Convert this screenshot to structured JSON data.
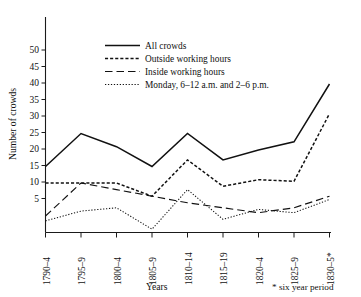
{
  "chart_data": {
    "type": "line",
    "title": "",
    "xlabel": "Years",
    "ylabel": "Number of crowds",
    "categories": [
      "1790–4",
      "1795–9",
      "1800–4",
      "1805–9",
      "1810–14",
      "1815–19",
      "1820–4",
      "1825–9",
      "1830–5*"
    ],
    "ylim": [
      0,
      55
    ],
    "yticks": [
      5,
      10,
      15,
      20,
      25,
      30,
      35,
      40,
      45,
      50
    ],
    "grid": false,
    "legend_position": "upper-center",
    "footnote": "* six year period",
    "series": [
      {
        "name": "All crowds",
        "style": "solid",
        "values": [
          20,
          30,
          26,
          20,
          30,
          22,
          25,
          27.5,
          45
        ]
      },
      {
        "name": "Outside working hours",
        "style": "dashed-short",
        "values": [
          15,
          15,
          15,
          11,
          22,
          14,
          16,
          15.5,
          36
        ]
      },
      {
        "name": "Inside working hours",
        "style": "dashed-long",
        "values": [
          5,
          15,
          13,
          11,
          9,
          7.5,
          6,
          7.5,
          11
        ]
      },
      {
        "name": "Monday, 6–12 a.m. and 2–6 p.m.",
        "style": "dotted",
        "values": [
          3.5,
          6.5,
          7.5,
          1,
          13,
          4,
          7,
          6,
          10
        ]
      }
    ]
  },
  "legend": {
    "items": [
      {
        "label": "All crowds"
      },
      {
        "label": "Outside working hours"
      },
      {
        "label": "Inside working hours"
      },
      {
        "label": "Monday, 6–12 a.m. and 2–6 p.m."
      }
    ]
  },
  "axes": {
    "y_label": "Number of crowds",
    "x_label": "Years",
    "y_tick_labels": [
      "50",
      "45",
      "40",
      "35",
      "30",
      "25",
      "20",
      "15",
      "10",
      "5"
    ],
    "x_tick_labels": [
      "1790–4",
      "1795–9",
      "1800–4",
      "1805–9",
      "1810–14",
      "1815–19",
      "1820–4",
      "1825–9",
      "1830–5*"
    ]
  },
  "footnote": {
    "text": "* six year period"
  }
}
